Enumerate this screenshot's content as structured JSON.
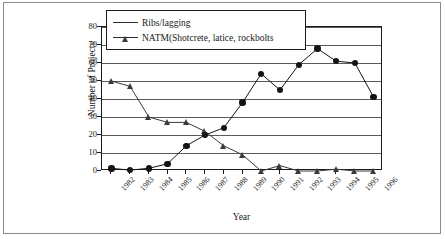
{
  "chart_data": {
    "type": "line",
    "title": "",
    "xlabel": "Year",
    "ylabel": "Number of Projects",
    "categories": [
      "1982",
      "1983",
      "1984",
      "1985",
      "1986",
      "1987",
      "1988",
      "1989",
      "1990",
      "1991",
      "1992",
      "1993",
      "1994",
      "1995",
      "1996"
    ],
    "ylim": [
      0,
      80
    ],
    "yticks": [
      0,
      10,
      20,
      30,
      40,
      50,
      60,
      70,
      80
    ],
    "grid": true,
    "legend_position": "top-left-inside",
    "series": [
      {
        "name": "Ribs/lagging",
        "marker": "triangle",
        "color": "#3a3a3a",
        "values": [
          50,
          47,
          30,
          27,
          27,
          22,
          14,
          9,
          0,
          3,
          0,
          0,
          1,
          0,
          0
        ]
      },
      {
        "name": "NATM(Shotcrete, latice, rockbolts",
        "marker": "circle",
        "color": "#141414",
        "values": [
          1.5,
          0.5,
          1.5,
          4,
          14,
          20,
          24,
          38,
          54,
          45,
          59,
          68,
          61,
          60,
          41
        ]
      }
    ]
  },
  "legend": {
    "items": [
      {
        "label": "Ribs/lagging"
      },
      {
        "label": "NATM(Shotcrete, latice, rockbolts"
      }
    ]
  },
  "axes": {
    "y_title": "Number of Projects",
    "x_title": "Year",
    "y_tick_labels": [
      "80",
      "70",
      "60",
      "50",
      "40",
      "30",
      "20",
      "10",
      "0"
    ],
    "x_tick_labels": [
      "1982",
      "1983",
      "1984",
      "1985",
      "1986",
      "1987",
      "1988",
      "1989",
      "1990",
      "1991",
      "1992",
      "1993",
      "1994",
      "1995",
      "1996"
    ]
  },
  "colors": {
    "series_a": "#3a3a3a",
    "series_b": "#141414",
    "grid": "#5a5a5a",
    "axis": "#1a1a1a",
    "frame": "#8a8a8a",
    "background": "#ffffff"
  }
}
